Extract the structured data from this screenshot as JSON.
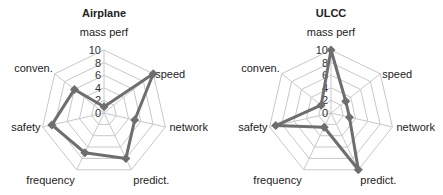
{
  "chart_data": [
    {
      "type": "radar",
      "title": "Airplane",
      "axes": [
        "mass perf",
        "speed",
        "network",
        "predict.",
        "frequency",
        "safety",
        "conven."
      ],
      "values": [
        1,
        10,
        5,
        8,
        7,
        8.5,
        6
      ],
      "rlim": [
        0,
        10
      ],
      "ticks": [
        "0",
        "2",
        "4",
        "6",
        "8",
        "10"
      ],
      "grid": true,
      "legend": null
    },
    {
      "type": "radar",
      "title": "ULCC",
      "axes": [
        "mass perf",
        "speed",
        "network",
        "predict.",
        "frequency",
        "safety",
        "conven."
      ],
      "values": [
        10,
        3,
        3,
        10,
        2.5,
        9,
        2
      ],
      "rlim": [
        0,
        10
      ],
      "ticks": [
        "0",
        "2",
        "4",
        "6",
        "8",
        "10"
      ],
      "grid": true,
      "legend": null
    }
  ],
  "colors": {
    "series": "#6e6e6e",
    "grid": "#c8c8c8",
    "text": "#222222"
  }
}
